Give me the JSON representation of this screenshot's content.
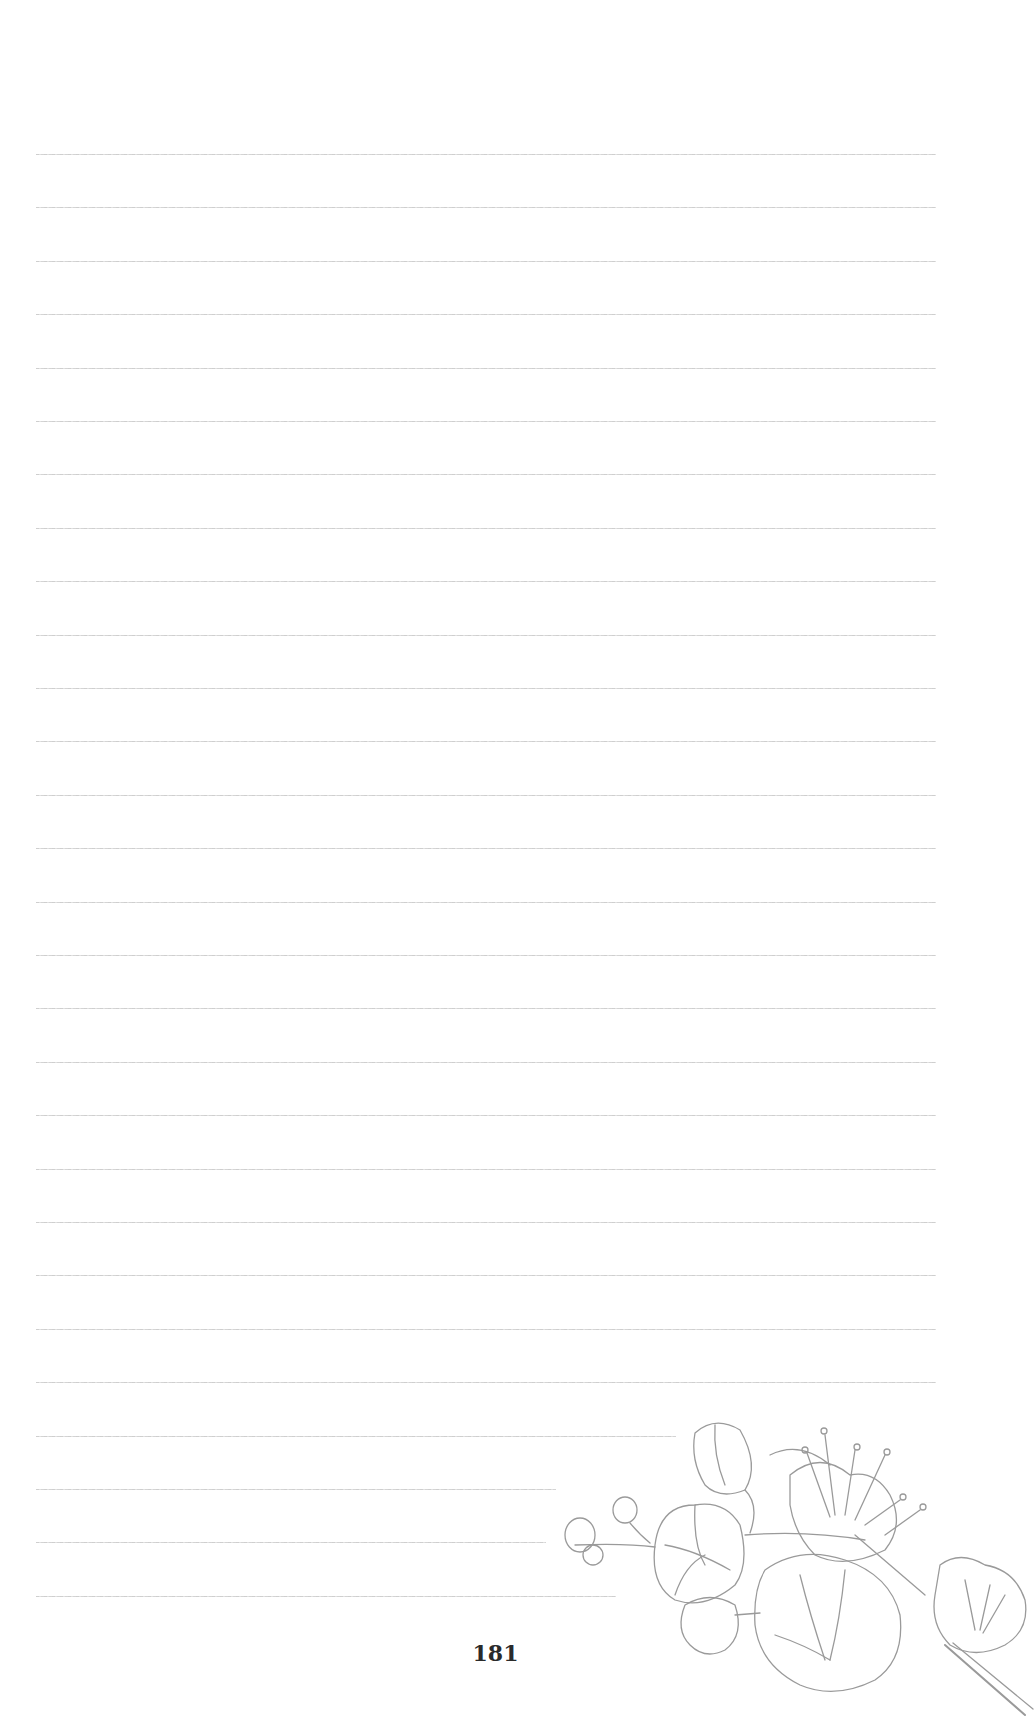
{
  "page": {
    "type": "lined-notes-page",
    "page_number": "181",
    "line_count": 28,
    "line_color": "#cccccc",
    "illustration": "cherry-blossom-branch"
  }
}
